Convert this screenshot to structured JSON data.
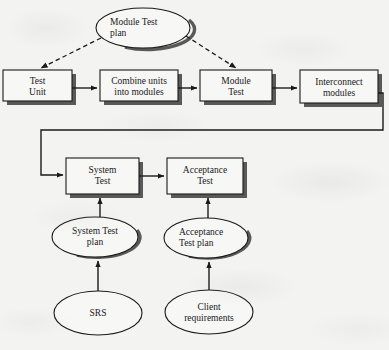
{
  "diagram": {
    "background_color": "#f3f3f2",
    "line_color": "#1a1a1a",
    "shadow_color": "#4d4d4d",
    "fill_color": "#f7f7f6",
    "process_boxes": [
      {
        "id": "test-unit",
        "label": "Test\nUnit",
        "x": 3,
        "y": 70,
        "w": 69,
        "h": 31
      },
      {
        "id": "combine-units",
        "label": "Combine units\ninto modules",
        "x": 100,
        "y": 70,
        "w": 78,
        "h": 31
      },
      {
        "id": "module-test",
        "label": "Module\nTest",
        "x": 200,
        "y": 70,
        "w": 72,
        "h": 31
      },
      {
        "id": "interconnect",
        "label": "Interconnect\nmodules",
        "x": 300,
        "y": 70,
        "w": 78,
        "h": 33
      },
      {
        "id": "system-test",
        "label": "System\nTest",
        "x": 66,
        "y": 158,
        "w": 73,
        "h": 36
      },
      {
        "id": "acceptance-test",
        "label": "Acceptance\nTest",
        "x": 167,
        "y": 158,
        "w": 76,
        "h": 36
      }
    ],
    "ellipses": [
      {
        "id": "module-test-plan",
        "label": "Module  Test\nplan",
        "cx": 143,
        "cy": 28,
        "rx": 47,
        "ry": 20,
        "align": "left"
      },
      {
        "id": "system-test-plan",
        "label": "System  Test\nplan",
        "cx": 95,
        "cy": 237,
        "rx": 43,
        "ry": 20,
        "align": "center"
      },
      {
        "id": "acceptance-test-plan",
        "label": "Acceptance\nTest plan",
        "cx": 206,
        "cy": 238,
        "rx": 42,
        "ry": 20,
        "align": "left"
      },
      {
        "id": "srs",
        "label": "SRS",
        "cx": 98,
        "cy": 313,
        "rx": 44,
        "ry": 22,
        "align": "center"
      },
      {
        "id": "client-requirements",
        "label": "Client\nrequirements",
        "cx": 209,
        "cy": 312,
        "rx": 44,
        "ry": 22,
        "align": "center"
      }
    ],
    "connectors": [
      {
        "id": "test-unit-to-combine",
        "style": "solid",
        "from": "test-unit",
        "to": "combine-units"
      },
      {
        "id": "combine-to-module-test",
        "style": "solid",
        "from": "combine-units",
        "to": "module-test"
      },
      {
        "id": "module-test-to-interconnect",
        "style": "solid",
        "from": "module-test",
        "to": "interconnect"
      },
      {
        "id": "interconnect-to-system-test",
        "style": "solid",
        "from": "interconnect",
        "to": "system-test"
      },
      {
        "id": "system-test-to-acceptance-test",
        "style": "solid",
        "from": "system-test",
        "to": "acceptance-test"
      },
      {
        "id": "plan-to-test-unit",
        "style": "dashed",
        "from": "module-test-plan",
        "to": "test-unit"
      },
      {
        "id": "plan-to-module-test",
        "style": "dashed",
        "from": "module-test-plan",
        "to": "module-test"
      },
      {
        "id": "system-plan-to-system-test",
        "style": "solid",
        "from": "system-test-plan",
        "to": "system-test"
      },
      {
        "id": "acceptance-plan-to-acceptance",
        "style": "solid",
        "from": "acceptance-test-plan",
        "to": "acceptance-test"
      },
      {
        "id": "srs-to-system-plan",
        "style": "solid",
        "from": "srs",
        "to": "system-test-plan"
      },
      {
        "id": "client-req-to-acceptance-plan",
        "style": "solid",
        "from": "client-requirements",
        "to": "acceptance-test-plan"
      }
    ]
  }
}
